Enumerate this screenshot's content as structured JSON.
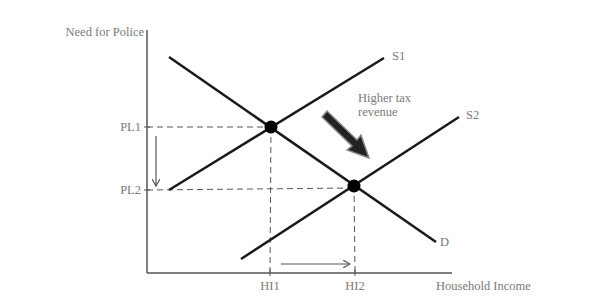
{
  "diagram": {
    "y_axis_label": "Need for Police",
    "x_axis_label": "Household Income",
    "y_ticks": [
      {
        "label": "PL1"
      },
      {
        "label": "PL2"
      }
    ],
    "x_ticks": [
      {
        "label": "HI1"
      },
      {
        "label": "HI2"
      }
    ],
    "curves": {
      "s1_label": "S1",
      "s2_label": "S2",
      "d_label": "D"
    },
    "annotation": {
      "line1": "Higher tax",
      "line2": "revenue"
    },
    "colors": {
      "line": "#1a1a1a",
      "axis": "#555555",
      "text": "#7a7a7a",
      "point": "#000000"
    }
  }
}
